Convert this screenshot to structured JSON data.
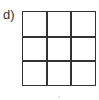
{
  "figure": {
    "label": "d)",
    "grid": {
      "rows": 3,
      "cols": 3
    },
    "line_color": "#333333"
  }
}
